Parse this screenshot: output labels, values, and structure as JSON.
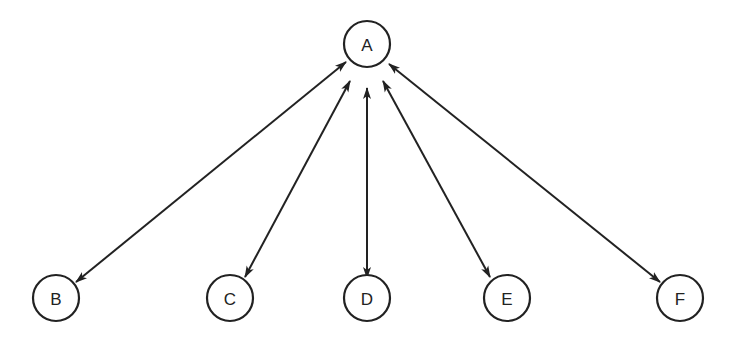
{
  "diagram": {
    "type": "star-network",
    "stroke_color": "#222222",
    "background": "#ffffff",
    "nodes": [
      {
        "id": "A",
        "label": "A",
        "cx": 367,
        "cy": 44,
        "r": 23
      },
      {
        "id": "B",
        "label": "B",
        "cx": 56,
        "cy": 298,
        "r": 23
      },
      {
        "id": "C",
        "label": "C",
        "cx": 230,
        "cy": 298,
        "r": 23
      },
      {
        "id": "D",
        "label": "D",
        "cx": 367,
        "cy": 298,
        "r": 23
      },
      {
        "id": "E",
        "label": "E",
        "cx": 507,
        "cy": 298,
        "r": 23
      },
      {
        "id": "F",
        "label": "F",
        "cx": 680,
        "cy": 298,
        "r": 23
      }
    ],
    "edges": [
      {
        "from": "A",
        "to": "B",
        "direction": "bidirectional",
        "x1": 346,
        "y1": 62,
        "x2": 76,
        "y2": 282
      },
      {
        "from": "A",
        "to": "C",
        "direction": "bidirectional",
        "x1": 350,
        "y1": 81,
        "x2": 245,
        "y2": 277
      },
      {
        "from": "A",
        "to": "D",
        "direction": "bidirectional",
        "x1": 367,
        "y1": 88,
        "x2": 367,
        "y2": 278
      },
      {
        "from": "A",
        "to": "E",
        "direction": "bidirectional",
        "x1": 383,
        "y1": 81,
        "x2": 490,
        "y2": 277
      },
      {
        "from": "A",
        "to": "F",
        "direction": "bidirectional",
        "x1": 389,
        "y1": 64,
        "x2": 660,
        "y2": 282
      }
    ]
  }
}
